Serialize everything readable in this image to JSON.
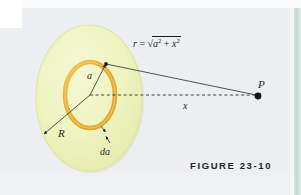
{
  "figure": {
    "caption": "FIGURE 23-10",
    "colors": {
      "disk_fill": "#eef3c0",
      "disk_edge": "#dfe89c",
      "ring_stroke": "#e8a92e",
      "ring_highlight": "#f6cf63",
      "line_color": "#3c3f46",
      "background": "#eceef2",
      "page_edge": "#c3d8d1",
      "caption_color": "#23252b"
    },
    "labels": {
      "r_formula": {
        "name": "r",
        "equals": "=",
        "radicand_first": "a",
        "radicand_first_exp": "2",
        "plus": "+",
        "radicand_second": "x",
        "radicand_second_exp": "2",
        "plain": "r = √(a² + x²)"
      },
      "point_P": "P",
      "axis_distance": "x",
      "ring_radius": "a",
      "disk_radius": "R",
      "ring_width": "da"
    },
    "geometry": {
      "disk": {
        "cx": 89,
        "cy": 98,
        "rx": 53,
        "ry": 73
      },
      "ring": {
        "cx": 90,
        "cy": 95,
        "rx": 25,
        "ry": 33
      },
      "point_P": {
        "x": 258,
        "y": 96
      },
      "ring_point_top_right": {
        "x": 106,
        "y": 64
      },
      "center": {
        "x": 90,
        "y": 95
      }
    }
  }
}
